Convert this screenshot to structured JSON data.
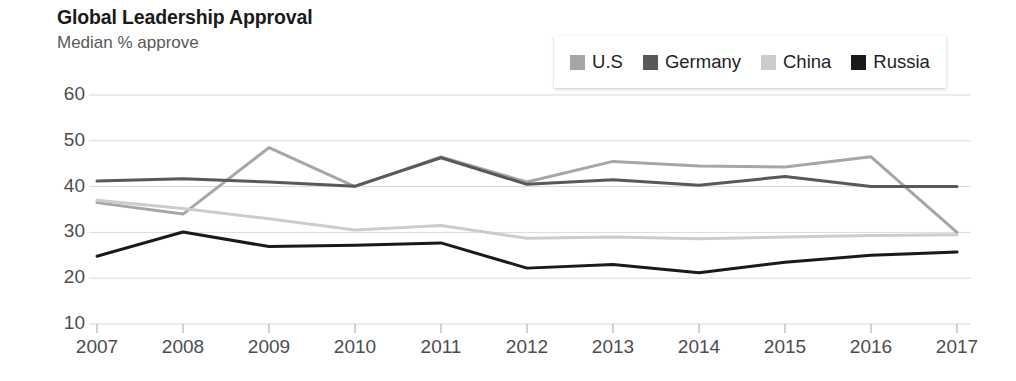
{
  "header": {
    "title": "Global Leadership Approval",
    "subtitle": "Median % approve"
  },
  "legend": {
    "position": "top-right",
    "items": [
      {
        "label": "U.S",
        "color": "#a6a6a6",
        "icon": "square-swatch"
      },
      {
        "label": "Germany",
        "color": "#595959",
        "icon": "square-swatch"
      },
      {
        "label": "China",
        "color": "#cccccc",
        "icon": "square-swatch"
      },
      {
        "label": "Russia",
        "color": "#1a1a1a",
        "icon": "square-swatch"
      }
    ]
  },
  "axes": {
    "y_ticks": [
      "60",
      "50",
      "40",
      "30",
      "20",
      "10"
    ],
    "x_ticks": [
      "2007",
      "2008",
      "2009",
      "2010",
      "2011",
      "2012",
      "2013",
      "2014",
      "2015",
      "2016",
      "2017"
    ]
  },
  "chart_data": {
    "type": "line",
    "title": "Global Leadership Approval",
    "subtitle": "Median % approve",
    "xlabel": "",
    "ylabel": "Median % approve",
    "x": [
      2007,
      2008,
      2009,
      2010,
      2011,
      2012,
      2013,
      2014,
      2015,
      2016,
      2017
    ],
    "categories": [
      "2007",
      "2008",
      "2009",
      "2010",
      "2011",
      "2012",
      "2013",
      "2014",
      "2015",
      "2016",
      "2017"
    ],
    "ylim": [
      10,
      60
    ],
    "yticks": [
      10,
      20,
      30,
      40,
      50,
      60
    ],
    "grid": true,
    "legend_position": "top-right",
    "series": [
      {
        "name": "U.S",
        "color": "#a6a6a6",
        "values": [
          36.5,
          34.0,
          48.5,
          40.0,
          46.5,
          41.0,
          45.5,
          44.5,
          44.3,
          46.5,
          30.0
        ]
      },
      {
        "name": "Germany",
        "color": "#595959",
        "values": [
          41.2,
          41.7,
          41.0,
          40.1,
          46.3,
          40.5,
          41.5,
          40.3,
          42.2,
          40.0,
          40.0
        ]
      },
      {
        "name": "China",
        "color": "#cccccc",
        "values": [
          37.0,
          35.2,
          33.0,
          30.5,
          31.5,
          28.7,
          29.0,
          28.6,
          29.0,
          29.3,
          29.5
        ]
      },
      {
        "name": "Russia",
        "color": "#1a1a1a",
        "values": [
          24.8,
          30.1,
          26.9,
          27.2,
          27.7,
          22.2,
          23.0,
          21.2,
          23.5,
          25.0,
          25.7
        ]
      }
    ]
  }
}
